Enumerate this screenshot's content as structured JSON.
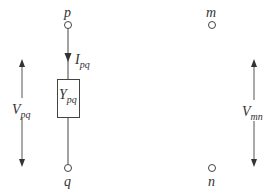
{
  "diagram": {
    "nodes": {
      "p": {
        "label": "p"
      },
      "q": {
        "label": "q"
      },
      "m": {
        "label": "m"
      },
      "n": {
        "label": "n"
      }
    },
    "element": {
      "label_main": "Y",
      "label_sub": "pq"
    },
    "current": {
      "label_main": "I",
      "label_sub": "pq"
    },
    "voltage_left": {
      "label_main": "V",
      "label_sub": "pq"
    },
    "voltage_right": {
      "label_main": "V",
      "label_sub": "mn"
    },
    "colors": {
      "line": "#444444",
      "text": "#333333",
      "background": "#ffffff"
    }
  }
}
